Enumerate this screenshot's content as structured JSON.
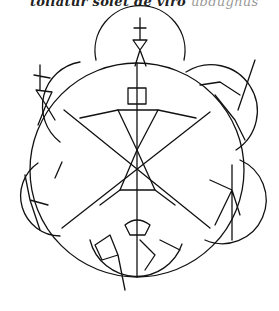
{
  "caption": {
    "dark_text": "tollatur solet de viro",
    "faint_text": "ubdugnus"
  },
  "illustration": {
    "description": "Manuscript drawing: large central circle divided into six sectors with an hourglass-shaped figure, ringed by six smaller circles each containing a dancing stick figure",
    "central_circle": {
      "cx": 137,
      "cy": 170,
      "r": 107,
      "sectors": 6
    },
    "outer_circles": [
      {
        "name": "top",
        "cx": 140,
        "cy": 55,
        "r": 45
      },
      {
        "name": "upper-left",
        "cx": 52,
        "cy": 100,
        "r": 45
      },
      {
        "name": "upper-right",
        "cx": 220,
        "cy": 100,
        "r": 42
      },
      {
        "name": "lower-left",
        "cx": 50,
        "cy": 198,
        "r": 40
      },
      {
        "name": "lower-right",
        "cx": 225,
        "cy": 198,
        "r": 40
      },
      {
        "name": "bottom",
        "cx": 137,
        "cy": 248,
        "r": 48
      }
    ],
    "ink_color": "#111111",
    "paper_color": "#ffffff"
  }
}
